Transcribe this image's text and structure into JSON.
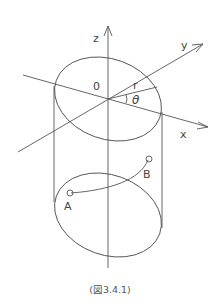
{
  "diagram": {
    "type": "cylindrical-coordinate-figure",
    "axes": {
      "z_label": "z",
      "y_label": "y",
      "x_label": "x"
    },
    "origin_label": "0",
    "radius_label": "r",
    "angle_label": "θ",
    "points": [
      {
        "label": "A"
      },
      {
        "label": "B"
      }
    ],
    "line_color": "#555555",
    "background": "#ffffff"
  },
  "caption": "(図3.4.1)"
}
